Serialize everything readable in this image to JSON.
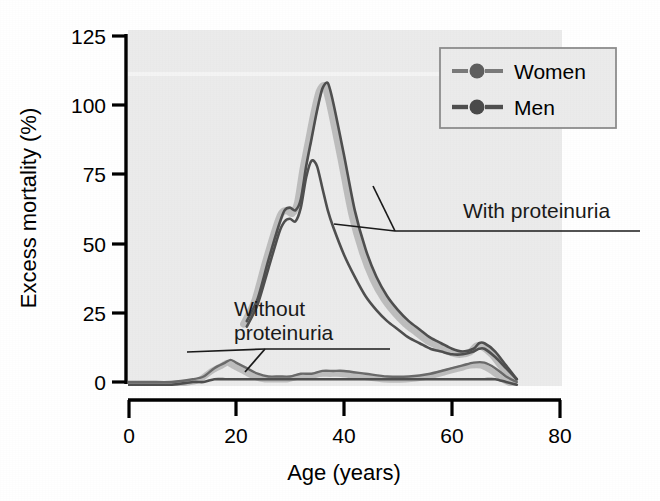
{
  "figure": {
    "background_color": "#ffffff",
    "plot_background_color": "#ebebeb",
    "axis_color": "#000000",
    "women_color": "#bdbdbd",
    "men_color": "#5a5a5a",
    "annotation_color": "#1a1a1a"
  },
  "chart_data": {
    "type": "line",
    "title": "",
    "xlabel": "Age (years)",
    "ylabel": "Excess mortality (%)",
    "xlim": [
      0,
      80
    ],
    "ylim": [
      0,
      125
    ],
    "xticks": [
      0,
      20,
      40,
      60,
      80
    ],
    "yticks": [
      0,
      25,
      50,
      75,
      100,
      125
    ],
    "xtick_labels": [
      "0",
      "20",
      "40",
      "60",
      "80"
    ],
    "ytick_labels": [
      "0",
      "25",
      "50",
      "75",
      "100",
      "125"
    ],
    "grid": false,
    "legend_position": "top-right",
    "legend_entries": [
      "Women",
      "Men"
    ],
    "annotations": [
      {
        "text": "With proteinuria",
        "x": 52,
        "y": 63
      },
      {
        "text": "Without proteinuria",
        "x": 31,
        "y": 25
      }
    ],
    "series": [
      {
        "name": "Women with proteinuria",
        "group": "With proteinuria",
        "sex": "Women",
        "x": [
          22,
          24,
          26,
          28,
          29,
          30,
          31,
          32,
          33,
          34,
          35,
          36,
          37,
          38,
          40,
          42,
          44,
          46,
          48,
          50,
          52,
          54,
          56,
          58,
          60,
          62,
          64,
          65,
          66,
          68,
          70,
          72
        ],
        "y": [
          22,
          30,
          44,
          57,
          62,
          63,
          62,
          66,
          78,
          88,
          98,
          106,
          108,
          101,
          82,
          62,
          48,
          38,
          31,
          26,
          22,
          19,
          16,
          14,
          12,
          11,
          12,
          14,
          14,
          11,
          6,
          1
        ]
      },
      {
        "name": "Men with proteinuria",
        "group": "With proteinuria",
        "sex": "Men",
        "x": [
          22,
          24,
          26,
          28,
          29,
          30,
          31,
          32,
          33,
          34,
          35,
          36,
          37,
          38,
          40,
          42,
          44,
          46,
          48,
          50,
          52,
          54,
          56,
          58,
          60,
          62,
          64,
          65,
          66,
          68,
          70,
          72
        ],
        "y": [
          20,
          28,
          41,
          54,
          58,
          59,
          58,
          63,
          74,
          80,
          78,
          70,
          62,
          56,
          46,
          38,
          31,
          26,
          22,
          19,
          16,
          14,
          12,
          11,
          10,
          10,
          11,
          12,
          12,
          9,
          5,
          1
        ]
      },
      {
        "name": "Women without proteinuria",
        "group": "Without proteinuria",
        "sex": "Women",
        "x": [
          0,
          4,
          8,
          12,
          14,
          16,
          18,
          19,
          20,
          22,
          24,
          26,
          28,
          30,
          32,
          34,
          36,
          38,
          40,
          44,
          48,
          52,
          56,
          60,
          62,
          64,
          66,
          68,
          70,
          72
        ],
        "y": [
          0,
          0,
          0,
          1,
          2,
          5,
          7,
          8,
          7,
          5,
          3,
          2,
          2,
          2,
          3,
          3,
          4,
          4,
          4,
          3,
          2,
          2,
          3,
          5,
          6,
          7,
          7,
          5,
          2,
          0
        ]
      },
      {
        "name": "Men without proteinuria",
        "group": "Without proteinuria",
        "sex": "Men",
        "x": [
          0,
          4,
          8,
          12,
          14,
          16,
          18,
          19,
          20,
          22,
          24,
          26,
          28,
          30,
          32,
          34,
          36,
          38,
          40,
          44,
          48,
          52,
          56,
          60,
          62,
          64,
          66,
          68,
          70,
          72
        ],
        "y": [
          -1,
          -1,
          -1,
          0,
          0,
          1,
          1,
          1,
          1,
          1,
          1,
          1,
          1,
          1,
          1,
          1,
          1,
          1,
          1,
          1,
          1,
          1,
          1,
          1,
          1,
          1,
          1,
          1,
          0,
          -1
        ]
      }
    ]
  }
}
